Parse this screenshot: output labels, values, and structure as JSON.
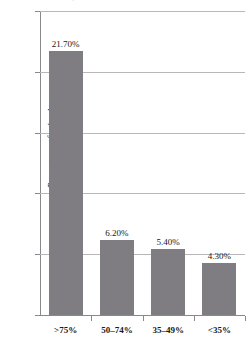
{
  "chart_data": {
    "type": "bar",
    "title": "",
    "xlabel": "",
    "ylabel": "Percentage of schools",
    "categories": [
      ">75%",
      "50–74%",
      "35–49%",
      "<35%"
    ],
    "values": [
      21.7,
      6.2,
      5.4,
      4.3
    ],
    "value_labels": [
      "21.70%",
      "6.20%",
      "5.40%",
      "4.30%"
    ],
    "ylim": [
      0,
      25
    ],
    "yticks": [
      0,
      5,
      10,
      15,
      20,
      25
    ],
    "ytick_labels": [
      "0%",
      "5%",
      "10%",
      "15%",
      "20%",
      "25%"
    ],
    "grid": true,
    "legend": false,
    "bar_color": "#7f7d82",
    "gridline_color": "#b9b7ba",
    "axis_color": "#8a888c",
    "background": "#ffffff"
  },
  "axes": {
    "y_title": "Percentage of schools"
  },
  "clipped_title_artifact": "·"
}
